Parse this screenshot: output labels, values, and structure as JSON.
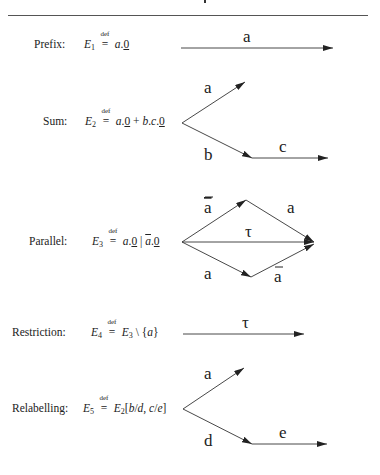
{
  "header": {
    "rule": true
  },
  "rows": [
    {
      "id": "prefix",
      "label": "Prefix:",
      "expr": {
        "lhs": "E",
        "sub": "1",
        "def": "def",
        "rhs": "a.0"
      },
      "edges": [
        {
          "from": [
            181,
            48
          ],
          "to": [
            333,
            48
          ],
          "label": "a"
        }
      ]
    },
    {
      "id": "sum",
      "label": "Sum:",
      "expr": {
        "lhs": "E",
        "sub": "2",
        "def": "def",
        "rhs": "a.0 + b.c.0"
      },
      "edges": [
        {
          "from": [
            182,
            123
          ],
          "to": [
            245,
            82
          ],
          "label": "a"
        },
        {
          "from": [
            182,
            123
          ],
          "to": [
            252,
            158
          ],
          "label": "b"
        },
        {
          "from": [
            252,
            158
          ],
          "to": [
            328,
            158
          ],
          "label": "c"
        }
      ]
    },
    {
      "id": "parallel",
      "label": "Parallel:",
      "expr": {
        "lhs": "E",
        "sub": "3",
        "def": "def",
        "rhs": "a.0 | ā.0"
      },
      "edges": [
        {
          "from": [
            182,
            242
          ],
          "to": [
            246,
            200
          ],
          "label": "ā"
        },
        {
          "from": [
            246,
            200
          ],
          "to": [
            314,
            242
          ],
          "label": "a"
        },
        {
          "from": [
            182,
            242
          ],
          "to": [
            314,
            242
          ],
          "label": "τ"
        },
        {
          "from": [
            182,
            242
          ],
          "to": [
            251,
            277
          ],
          "label": "a"
        },
        {
          "from": [
            251,
            277
          ],
          "to": [
            314,
            244
          ],
          "label": "ā"
        }
      ]
    },
    {
      "id": "restriction",
      "label": "Restriction:",
      "expr": {
        "lhs": "E",
        "sub": "4",
        "def": "def",
        "rhs": "E3 \\ {a}"
      },
      "edges": [
        {
          "from": [
            183,
            334
          ],
          "to": [
            304,
            334
          ],
          "label": "τ"
        }
      ]
    },
    {
      "id": "relabelling",
      "label": "Relabelling:",
      "expr": {
        "lhs": "E",
        "sub": "5",
        "def": "def",
        "rhs": "E2[b/d, c/e]"
      },
      "edges": [
        {
          "from": [
            183,
            409
          ],
          "to": [
            244,
            368
          ],
          "label": "a"
        },
        {
          "from": [
            183,
            409
          ],
          "to": [
            252,
            444
          ],
          "label": "d"
        },
        {
          "from": [
            252,
            444
          ],
          "to": [
            327,
            444
          ],
          "label": "e"
        }
      ]
    }
  ],
  "labels": {
    "prefix_a": "a",
    "sum_a": "a",
    "sum_b": "b",
    "sum_c": "c",
    "par_abar_top": "a",
    "par_a_right": "a",
    "par_tau": "τ",
    "par_a_bottom": "a",
    "par_abar_bottom": "a",
    "res_tau": "τ",
    "rel_a": "a",
    "rel_d": "d",
    "rel_e": "e"
  },
  "text": {
    "prefix_label": "Prefix:",
    "sum_label": "Sum:",
    "parallel_label": "Parallel:",
    "restriction_label": "Restriction:",
    "relabelling_label": "Relabelling:",
    "E": "E",
    "sub1": "1",
    "sub2": "2",
    "sub3": "3",
    "sub4": "4",
    "sub5": "5",
    "def": "def",
    "eq": "=",
    "a": "a",
    "b": "b",
    "c": "c",
    "d": "d",
    "e": "e",
    "dot": ".",
    "zero": "0",
    "plus": " + ",
    "bar": " | ",
    "setminus": " \\ ",
    "lbrace": "{",
    "rbrace": "}",
    "lbrack": "[",
    "rbrack": "]",
    "slash": "/",
    "comma": ", "
  },
  "colors": {
    "ink": "#222222",
    "rule": "#555555",
    "background": "#ffffff"
  }
}
